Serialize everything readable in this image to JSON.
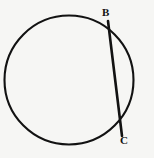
{
  "figure": {
    "kind": "geometry-diagram",
    "background_color": "#f6f6f4",
    "stroke_color": "#121212",
    "canvas": {
      "width": 154,
      "height": 158
    },
    "circle": {
      "name": "circle",
      "center_x": 69,
      "center_y": 80,
      "radius": 64.5,
      "stroke_width": 2.1,
      "fill": "none"
    },
    "chord": {
      "name": "chord-BC",
      "from": "B",
      "to": "C",
      "x1": 108,
      "y1": 21,
      "x2": 122,
      "y2": 136,
      "stroke_width": 2.6
    },
    "points": [
      {
        "id": "B",
        "label": "B",
        "x": 108,
        "y": 21,
        "label_x": 102,
        "label_y": 7
      },
      {
        "id": "C",
        "label": "C",
        "x": 122,
        "y": 136,
        "label_x": 120,
        "label_y": 135
      }
    ]
  }
}
